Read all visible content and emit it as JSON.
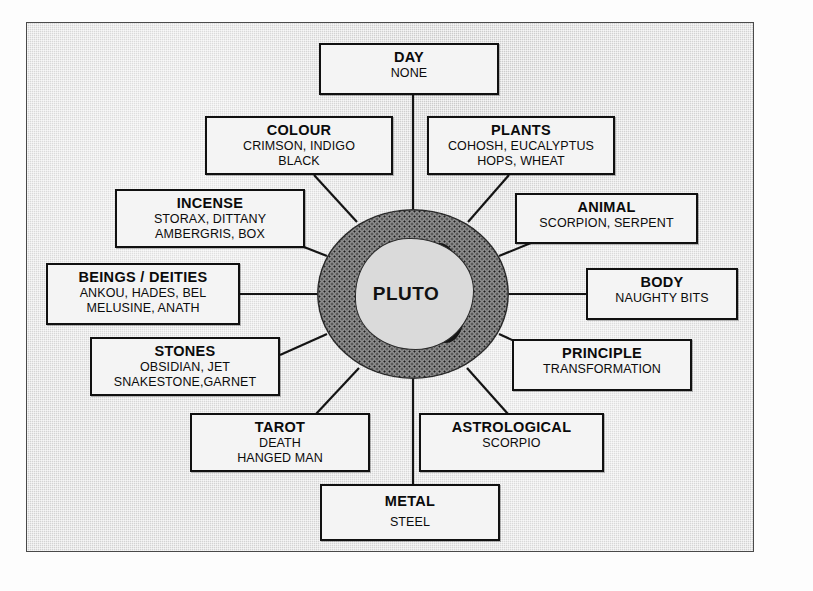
{
  "diagram": {
    "center": {
      "label": "PLUTO",
      "icon": "planet-ring-icon"
    },
    "nodes": [
      {
        "key": "day",
        "title": "DAY",
        "lines": [
          "NONE"
        ]
      },
      {
        "key": "colour",
        "title": "COLOUR",
        "lines": [
          "CRIMSON, INDIGO",
          "BLACK"
        ]
      },
      {
        "key": "plants",
        "title": "PLANTS",
        "lines": [
          "COHOSH, EUCALYPTUS",
          "HOPS, WHEAT"
        ]
      },
      {
        "key": "incense",
        "title": "INCENSE",
        "lines": [
          "STORAX, DITTANY",
          "AMBERGRIS, BOX"
        ]
      },
      {
        "key": "animal",
        "title": "ANIMAL",
        "lines": [
          "SCORPION, SERPENT"
        ]
      },
      {
        "key": "beings",
        "title": "BEINGS / DEITIES",
        "lines": [
          "ANKOU, HADES, BEL",
          "MELUSINE, ANATH"
        ]
      },
      {
        "key": "body",
        "title": "BODY",
        "lines": [
          "NAUGHTY BITS"
        ]
      },
      {
        "key": "stones",
        "title": "STONES",
        "lines": [
          "OBSIDIAN, JET",
          "SNAKESTONE,GARNET"
        ]
      },
      {
        "key": "principle",
        "title": "PRINCIPLE",
        "lines": [
          "TRANSFORMATION"
        ]
      },
      {
        "key": "tarot",
        "title": "TAROT",
        "lines": [
          "DEATH",
          "HANGED MAN"
        ]
      },
      {
        "key": "astrological",
        "title": "ASTROLOGICAL",
        "lines": [
          "SCORPIO"
        ]
      },
      {
        "key": "metal",
        "title": "METAL",
        "lines": [
          "STEEL"
        ]
      }
    ],
    "colors": {
      "background": "#d3d3d3",
      "box_fill": "#f4f4f4",
      "box_border": "#101010",
      "ring": "#8d8d8d",
      "text": "#0b0b0b",
      "frame_border": "#4a4a4a"
    }
  }
}
